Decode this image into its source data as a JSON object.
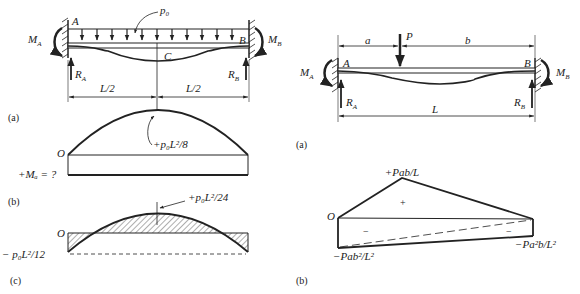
{
  "left_figure": {
    "beam": {
      "end_left_label": "A",
      "end_right_label": "B",
      "mid_label": "C",
      "load_label": "p₀",
      "moment_left": "M",
      "moment_left_sub": "A",
      "moment_right": "M",
      "moment_right_sub": "B",
      "reaction_left": "R",
      "reaction_left_sub": "A",
      "reaction_right": "R",
      "reaction_right_sub": "B",
      "dim_left": "L/2",
      "dim_right": "L/2",
      "caption": "(a)"
    },
    "moment_diagram_simple": {
      "origin_label": "O",
      "peak_label": "+p₀L²/8",
      "unknown_label": "+Mₐ = ?",
      "caption": "(b)"
    },
    "moment_diagram_fixed": {
      "origin_label": "O",
      "peak_label": "+p₀L²/24",
      "end_label": "− p₀L²/12",
      "caption": "(c)"
    }
  },
  "right_figure": {
    "beam": {
      "end_left_label": "A",
      "end_right_label": "B",
      "load_label": "P",
      "dim_a": "a",
      "dim_b": "b",
      "dim_L": "L",
      "moment_left": "M",
      "moment_left_sub": "A",
      "moment_right": "M",
      "moment_right_sub": "B",
      "reaction_left": "R",
      "reaction_left_sub": "A",
      "reaction_right": "R",
      "reaction_right_sub": "B",
      "caption": "(a)"
    },
    "moment_diagram": {
      "origin_label": "O",
      "peak_label": "+Pab/L",
      "plus_sign": "+",
      "minus_sign_left": "−",
      "minus_sign_right": "−",
      "end_left_label": "−Pab²/L²",
      "end_right_label": "−Pa²b/L²",
      "caption": "(b)"
    }
  }
}
